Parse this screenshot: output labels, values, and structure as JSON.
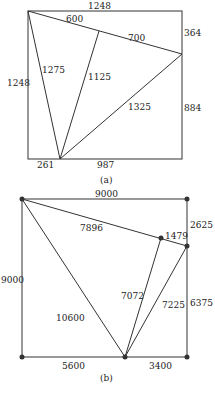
{
  "figure_a": {
    "caption": "(a)",
    "labels": {
      "top": "1248",
      "left": "1248",
      "right_upper": "364",
      "right_lower": "884",
      "bottom_left": "261",
      "bottom_right": "987",
      "edge_600": "600",
      "edge_700": "700",
      "edge_1275": "1275",
      "edge_1125": "1125",
      "edge_1325": "1325"
    }
  },
  "figure_b": {
    "caption": "(b)",
    "labels": {
      "top": "9000",
      "left": "9000",
      "right_upper": "2625",
      "right_lower": "6375",
      "bottom_left": "5600",
      "bottom_right": "3400",
      "edge_7896": "7896",
      "edge_1479": "1479",
      "edge_10600": "10600",
      "edge_7072": "7072",
      "edge_7225": "7225"
    }
  },
  "colors": {
    "line": "#333333",
    "dot": "#333333"
  }
}
